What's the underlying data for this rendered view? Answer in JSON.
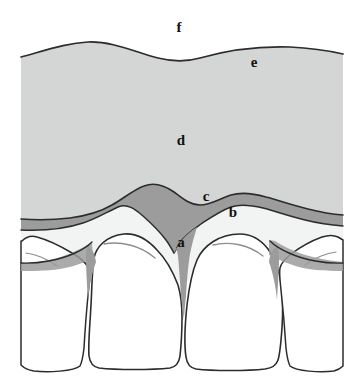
{
  "figure": {
    "background_color": "#ffffff"
  },
  "colors": {
    "alveolar_mucosa": "#d4d6d5",
    "free_gingiva_band": "#9b9c9b",
    "attached_gingiva": "#f2f3f3",
    "tooth_enamel": "#ffffff",
    "outline": "#2c2c2c",
    "label_text": "#111111"
  },
  "labels": [
    {
      "id": "a",
      "text": "a",
      "x": 181,
      "y": 243,
      "structure": "interdental-papilla"
    },
    {
      "id": "b",
      "text": "b",
      "x": 233,
      "y": 213,
      "structure": "attached-gingiva"
    },
    {
      "id": "c",
      "text": "c",
      "x": 206,
      "y": 197,
      "structure": "free-gingival-groove"
    },
    {
      "id": "d",
      "text": "d",
      "x": 181,
      "y": 141,
      "structure": "alveolar-mucosa"
    },
    {
      "id": "e",
      "text": "e",
      "x": 254,
      "y": 63,
      "structure": "mucogingival-junction"
    },
    {
      "id": "f",
      "text": "f",
      "x": 179,
      "y": 28,
      "structure": "vestibule"
    }
  ],
  "regions": {
    "alveolar_mucosa": {
      "name": "alveolar-mucosa",
      "label_ref": "d",
      "fill": "#d4d6d5"
    },
    "free_gingiva": {
      "name": "free-gingiva-band",
      "label_ref": "c",
      "fill": "#9b9c9b"
    },
    "attached_gingiva": {
      "name": "attached-gingiva",
      "label_ref": "b",
      "fill": "#f2f3f3"
    },
    "vestibule": {
      "name": "vestibule-space",
      "label_ref": "f",
      "fill": "#ffffff"
    }
  },
  "teeth": [
    {
      "id": "tooth-left-lateral-incisor",
      "position": "left-outer",
      "partial": true
    },
    {
      "id": "tooth-left-central-incisor",
      "position": "left-center",
      "partial": false
    },
    {
      "id": "tooth-right-central-incisor",
      "position": "right-center",
      "partial": false
    },
    {
      "id": "tooth-right-lateral-incisor",
      "position": "right-outer",
      "partial": true
    }
  ]
}
